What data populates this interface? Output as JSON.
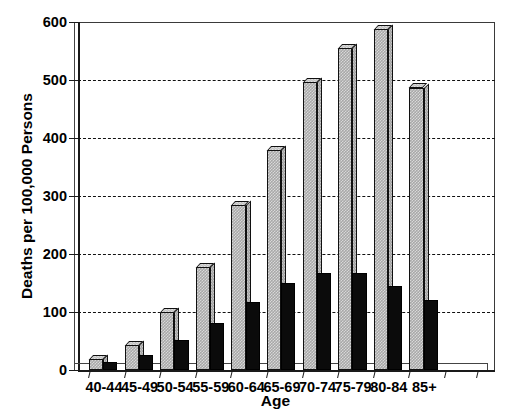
{
  "chart_data": {
    "type": "bar",
    "title": "",
    "xlabel": "Age",
    "ylabel": "Deaths per 100,000 Persons",
    "categories": [
      "40-44",
      "45-49",
      "50-54",
      "55-59",
      "60-64",
      "65-69",
      "70-74",
      "75-79",
      "80-84",
      "85+"
    ],
    "series": [
      {
        "name": "light-hatched-series",
        "style": "hatched-grey-3d",
        "values": [
          19,
          43,
          100,
          178,
          284,
          379,
          497,
          555,
          588,
          487
        ]
      },
      {
        "name": "dark-solid-series",
        "style": "solid-black",
        "values": [
          14,
          26,
          52,
          81,
          117,
          150,
          168,
          168,
          145,
          120
        ]
      }
    ],
    "ylim": [
      0,
      600
    ],
    "yticks": [
      0,
      100,
      200,
      300,
      400,
      500,
      600
    ],
    "ytick_labels": [
      "0",
      "100",
      "200",
      "300",
      "400",
      "500",
      "600"
    ],
    "grid": true,
    "grid_style": "dashed-horizontal",
    "grid_values": [
      100,
      200,
      300,
      400,
      500
    ],
    "legend": null,
    "legend_position": "none",
    "colors": {
      "light_series_fill": "#b8b8b8",
      "dark_series_fill": "#0b0b0b",
      "axis": "#1a1a1a",
      "grid": "#111111",
      "background": "#ffffff"
    }
  }
}
